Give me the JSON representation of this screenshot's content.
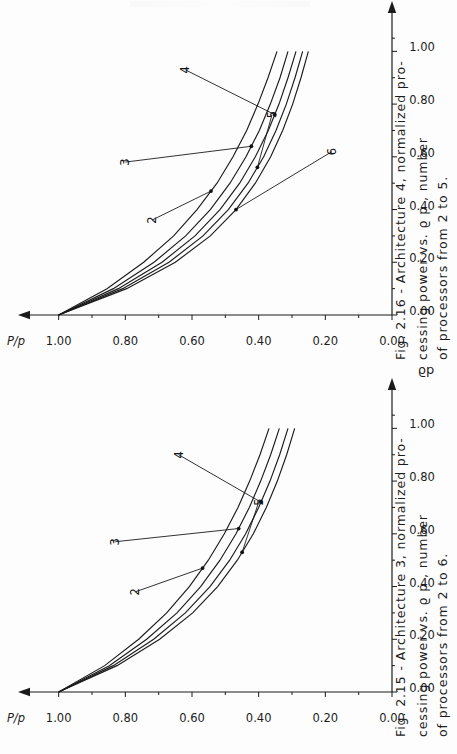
{
  "page": {
    "background_color": "#fdfdfd",
    "ink_color": "#1b1b1b",
    "orientation": "rotated-90-ccw"
  },
  "figures": [
    {
      "id": "fig-2-16",
      "caption_lines": [
        "Fig. 2.16  -  Architecture  4,   normalized  pro-",
        "cessing  power  vs.     ϱ p ,   number",
        "of  processors  from  2  to  5."
      ],
      "caption_label": "Fig. 2.16",
      "caption_text": "Fig. 2.16 - Architecture 4, normalized processing power vs. ϱp, number of processors from 2 to 5.",
      "chart_data": {
        "type": "line",
        "title": "",
        "xlabel": "ϱp",
        "ylabel": "P/p",
        "xlim": [
          0.0,
          1.1
        ],
        "ylim": [
          0.0,
          1.05
        ],
        "xticks": [
          "0.00",
          "0.20",
          "0.40",
          "0.60",
          "0.80",
          "1.00"
        ],
        "xtick_values": [
          0.0,
          0.2,
          0.4,
          0.6,
          0.8,
          1.0
        ],
        "yticks": [
          "0.00",
          "0.20",
          "0.40",
          "0.60",
          "0.80",
          "1.00"
        ],
        "ytick_values": [
          0.0,
          0.2,
          0.4,
          0.6,
          0.8,
          1.0
        ],
        "grid": false,
        "legend": "inline-curve-labels",
        "x": [
          0.0,
          0.1,
          0.2,
          0.3,
          0.4,
          0.5,
          0.6,
          0.7,
          0.8,
          0.9,
          1.0
        ],
        "series": [
          {
            "name": "2",
            "label": "2",
            "values": [
              1.0,
              0.855,
              0.745,
              0.655,
              0.585,
              0.525,
              0.477,
              0.436,
              0.402,
              0.372,
              0.345
            ]
          },
          {
            "name": "3",
            "label": "3",
            "values": [
              1.0,
              0.836,
              0.714,
              0.619,
              0.545,
              0.486,
              0.438,
              0.398,
              0.365,
              0.336,
              0.312
            ]
          },
          {
            "name": "4",
            "label": "4",
            "values": [
              1.0,
              0.821,
              0.69,
              0.591,
              0.516,
              0.457,
              0.41,
              0.371,
              0.339,
              0.312,
              0.288
            ]
          },
          {
            "name": "5",
            "label": "5",
            "values": [
              1.0,
              0.808,
              0.669,
              0.567,
              0.491,
              0.432,
              0.385,
              0.348,
              0.317,
              0.291,
              0.268
            ]
          },
          {
            "name": "6",
            "label": "6",
            "values": [
              1.0,
              0.796,
              0.65,
              0.545,
              0.468,
              0.41,
              0.364,
              0.328,
              0.298,
              0.273,
              0.251
            ]
          }
        ],
        "curve_labels": [
          "2",
          "3",
          "4",
          "5",
          "6"
        ]
      }
    },
    {
      "id": "fig-2-15",
      "caption_lines": [
        "Fig. 2.15  -  Architecture  3,   normalized  pro-",
        "cessing  power  vs.     ϱ p ,   number",
        "of  processors  from  2  to  6."
      ],
      "caption_label": "Fig. 2.15",
      "caption_text": "Fig. 2.15 - Architecture 3, normalized processing power vs. ϱp, number of processors from 2 to 6.",
      "chart_data": {
        "type": "line",
        "title": "",
        "xlabel": "ϱp",
        "ylabel": "P/p",
        "xlim": [
          0.0,
          1.1
        ],
        "ylim": [
          0.0,
          1.05
        ],
        "xticks": [
          "0.00",
          "0.20",
          "0.40",
          "0.60",
          "0.80",
          "1.00"
        ],
        "xtick_values": [
          0.0,
          0.2,
          0.4,
          0.6,
          0.8,
          1.0
        ],
        "yticks": [
          "0.00",
          "0.20",
          "0.40",
          "0.60",
          "0.80",
          "1.00"
        ],
        "ytick_values": [
          0.0,
          0.2,
          0.4,
          0.6,
          0.8,
          1.0
        ],
        "grid": false,
        "legend": "inline-curve-labels",
        "x": [
          0.0,
          0.1,
          0.2,
          0.3,
          0.4,
          0.5,
          0.6,
          0.7,
          0.8,
          0.9,
          1.0
        ],
        "series": [
          {
            "name": "2",
            "label": "2",
            "values": [
              1.0,
              0.862,
              0.76,
              0.676,
              0.608,
              0.551,
              0.503,
              0.462,
              0.427,
              0.396,
              0.369
            ]
          },
          {
            "name": "3",
            "label": "3",
            "values": [
              1.0,
              0.848,
              0.736,
              0.645,
              0.574,
              0.516,
              0.468,
              0.428,
              0.394,
              0.364,
              0.338
            ]
          },
          {
            "name": "4",
            "label": "4",
            "values": [
              1.0,
              0.836,
              0.715,
              0.62,
              0.546,
              0.487,
              0.439,
              0.4,
              0.366,
              0.337,
              0.312
            ]
          },
          {
            "name": "5",
            "label": "5",
            "values": [
              1.0,
              0.825,
              0.697,
              0.598,
              0.523,
              0.464,
              0.416,
              0.377,
              0.344,
              0.316,
              0.292
            ]
          }
        ],
        "curve_labels": [
          "2",
          "3",
          "4",
          "5"
        ]
      }
    }
  ]
}
